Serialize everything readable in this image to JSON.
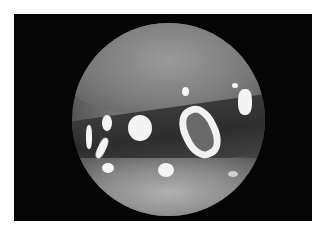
{
  "image": {
    "description": "Grayscale endoscopic view inside a circular scope field on a black rectangular frame, showing tissue with bright specular reflections",
    "colors": {
      "background": "#ffffff",
      "frame": "#050505",
      "tissue_mid": "#7a7a7a",
      "highlight": "#f4f4f4"
    }
  }
}
